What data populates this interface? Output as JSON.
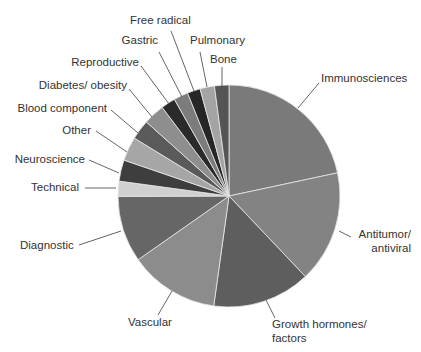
{
  "chart_data": {
    "type": "pie",
    "title": "",
    "start_angle_deg": 0,
    "direction": "clockwise",
    "unit": "percent",
    "categories": [
      "Immunosciences",
      "Antitumor/ antiviral",
      "Growth hormones/ factors",
      "Vascular",
      "Diagnostic",
      "Technical",
      "Neuroscience",
      "Other",
      "Blood component",
      "Diabetes/ obesity",
      "Reproductive",
      "Gastric",
      "Free radical",
      "Pulmonary",
      "Bone"
    ],
    "values": [
      21.7,
      16.3,
      14.3,
      13.1,
      9.7,
      2.2,
      3.1,
      3.5,
      2.9,
      3.1,
      2.1,
      2.1,
      1.9,
      2.1,
      2.1
    ],
    "colors": [
      "#7a7a7a",
      "#838383",
      "#5e5e5e",
      "#8c8c8c",
      "#666666",
      "#d0d0d0",
      "#3e3e3e",
      "#a6a6a6",
      "#5a5a5a",
      "#8e8e8e",
      "#2a2a2a",
      "#7c7c7c",
      "#262626",
      "#a4a4a4",
      "#555555"
    ],
    "labels": [
      {
        "text": [
          "Immunosciences"
        ],
        "x": 321,
        "y": 82,
        "anchor": "start",
        "line": [
          [
            298,
            108
          ],
          [
            319,
            83
          ]
        ]
      },
      {
        "text": [
          "Antitumor/",
          "antiviral"
        ],
        "x": 411,
        "y": 238,
        "anchor": "end",
        "line": [
          [
            339,
            231
          ],
          [
            351,
            237
          ]
        ]
      },
      {
        "text": [
          "Growth hormones/",
          "factors"
        ],
        "x": 272,
        "y": 328,
        "anchor": "start",
        "line": [
          [
            266,
            300
          ],
          [
            275,
            318
          ]
        ]
      },
      {
        "text": [
          "Vascular"
        ],
        "x": 128,
        "y": 326,
        "anchor": "start",
        "line": [
          [
            172,
            291
          ],
          [
            158,
            315
          ]
        ]
      },
      {
        "text": [
          "Diagnostic"
        ],
        "x": 20,
        "y": 249,
        "anchor": "start",
        "line": [
          [
            121,
            231
          ],
          [
            79,
            245
          ]
        ]
      },
      {
        "text": [
          "Technical"
        ],
        "x": 79,
        "y": 191,
        "anchor": "end",
        "line": [
          [
            116,
            188
          ],
          [
            85,
            188
          ]
        ]
      },
      {
        "text": [
          "Neuroscience"
        ],
        "x": 85,
        "y": 163,
        "anchor": "end",
        "line": [
          [
            119,
            173
          ],
          [
            89,
            160
          ]
        ]
      },
      {
        "text": [
          "Other"
        ],
        "x": 91,
        "y": 134,
        "anchor": "end",
        "line": [
          [
            127,
            152
          ],
          [
            96,
            131
          ]
        ]
      },
      {
        "text": [
          "Blood component"
        ],
        "x": 107,
        "y": 112,
        "anchor": "end",
        "line": [
          [
            138,
            133
          ],
          [
            111,
            110
          ]
        ]
      },
      {
        "text": [
          "Diabetes/ obesity"
        ],
        "x": 127,
        "y": 89,
        "anchor": "end",
        "line": [
          [
            152,
            117
          ],
          [
            129,
            89
          ]
        ]
      },
      {
        "text": [
          "Reproductive"
        ],
        "x": 139,
        "y": 66,
        "anchor": "end",
        "line": [
          [
            169,
            104
          ],
          [
            141,
            66
          ]
        ]
      },
      {
        "text": [
          "Gastric"
        ],
        "x": 158,
        "y": 44,
        "anchor": "end",
        "line": [
          [
            182,
            97
          ],
          [
            159,
            52
          ]
        ]
      },
      {
        "text": [
          "Free radical"
        ],
        "x": 130,
        "y": 24,
        "anchor": "start",
        "line": [
          [
            194,
            91
          ],
          [
            171,
            31
          ]
        ]
      },
      {
        "text": [
          "Pulmonary"
        ],
        "x": 190,
        "y": 44,
        "anchor": "start",
        "line": [
          [
            207,
            87
          ],
          [
            200,
            52
          ]
        ]
      },
      {
        "text": [
          "Bone"
        ],
        "x": 210,
        "y": 63,
        "anchor": "start",
        "line": [
          [
            222,
            87
          ],
          [
            222,
            67
          ]
        ]
      }
    ],
    "center": [
      229,
      196
    ],
    "radius": 111,
    "legend": "none (direct labels with leader lines)"
  }
}
